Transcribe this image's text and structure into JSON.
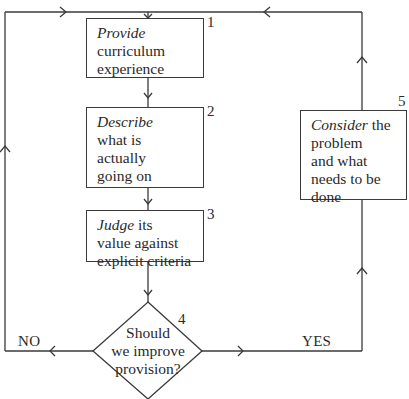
{
  "diagram": {
    "type": "flowchart",
    "nodes": [
      {
        "id": 1,
        "number": "1",
        "shape": "rectangle",
        "lines": [
          {
            "italic": "Provide",
            "rest": ""
          },
          {
            "italic": "",
            "rest": "curriculum"
          },
          {
            "italic": "",
            "rest": "experience"
          }
        ]
      },
      {
        "id": 2,
        "number": "2",
        "shape": "rectangle",
        "lines": [
          {
            "italic": "Describe",
            "rest": ""
          },
          {
            "italic": "",
            "rest": "what is"
          },
          {
            "italic": "",
            "rest": "actually"
          },
          {
            "italic": "",
            "rest": "going on"
          }
        ]
      },
      {
        "id": 3,
        "number": "3",
        "shape": "rectangle",
        "lines": [
          {
            "italic": "Judge",
            "rest": " its"
          },
          {
            "italic": "",
            "rest": "value against"
          },
          {
            "italic": "",
            "rest": "explicit criteria"
          }
        ]
      },
      {
        "id": 4,
        "number": "4",
        "shape": "diamond",
        "lines": [
          {
            "italic": "",
            "rest": "Should"
          },
          {
            "italic": "",
            "rest": "we improve"
          },
          {
            "italic": "",
            "rest": "provision?"
          }
        ]
      },
      {
        "id": 5,
        "number": "5",
        "shape": "rectangle",
        "lines": [
          {
            "italic": "Consider",
            "rest": " the"
          },
          {
            "italic": "",
            "rest": "problem"
          },
          {
            "italic": "",
            "rest": "and what"
          },
          {
            "italic": "",
            "rest": "needs to be"
          },
          {
            "italic": "",
            "rest": "done"
          }
        ]
      }
    ],
    "edges": [
      {
        "from": 1,
        "to": 2
      },
      {
        "from": 2,
        "to": 3
      },
      {
        "from": 3,
        "to": 4
      },
      {
        "from": 4,
        "to": 1,
        "label": "NO"
      },
      {
        "from": 4,
        "to": 5,
        "label": "YES"
      },
      {
        "from": 5,
        "to": 1
      }
    ],
    "branch_labels": {
      "no": "NO",
      "yes": "YES"
    },
    "colors": {
      "line": "#3a3a3a",
      "text": "#2a2a2a",
      "background": "#ffffff"
    }
  }
}
